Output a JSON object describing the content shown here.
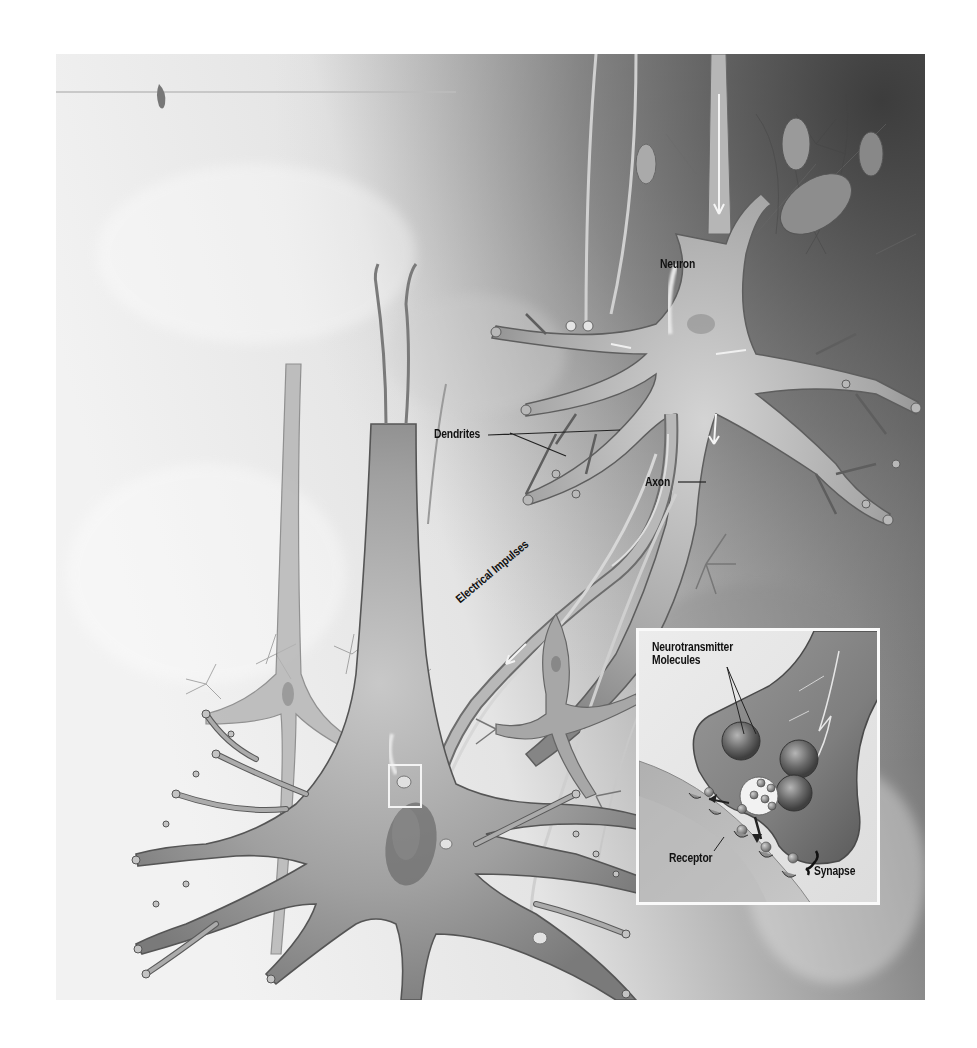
{
  "figure": {
    "labels": {
      "neuron": "Neuron",
      "dendrites": "Dendrites",
      "axon": "Axon",
      "electrical_impulses": "Electrical Impulses"
    },
    "inset": {
      "labels": {
        "neurotransmitter_line1": "Neurotransmitter",
        "neurotransmitter_line2": "Molecules",
        "receptor": "Receptor",
        "synapse": "Synapse"
      }
    },
    "colors": {
      "background_light": "#efefef",
      "background_dark": "#4a4a4a",
      "cell_fill": "#a9a9a9",
      "label_text": "#111111",
      "inset_border": "#fafafa"
    }
  }
}
